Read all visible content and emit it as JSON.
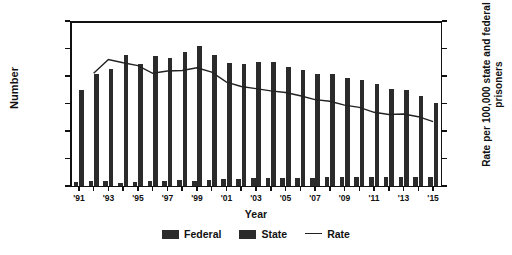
{
  "chart_data": {
    "type": "bar",
    "title": "",
    "xlabel": "Year",
    "ylabel": "Number",
    "ylabel_right": "Rate per 100,000 state and federal prisoners",
    "ylim": [
      0,
      30000
    ],
    "ylim_right": [
      0,
      3000
    ],
    "grid": false,
    "legend_position": "bottom-center",
    "x": [
      1991,
      1992,
      1993,
      1994,
      1995,
      1996,
      1997,
      1998,
      1999,
      2000,
      2001,
      2002,
      2003,
      2004,
      2005,
      2006,
      2007,
      2008,
      2009,
      2010,
      2011,
      2012,
      2013,
      2014,
      2015
    ],
    "categories": [
      "'91",
      "'92",
      "'93",
      "'94",
      "'95",
      "'96",
      "'97",
      "'98",
      "'99",
      "'00",
      "'01",
      "'02",
      "'03",
      "'04",
      "'05",
      "'06",
      "'07",
      "'08",
      "'09",
      "'10",
      "'11",
      "'12",
      "'13",
      "'14",
      "'15"
    ],
    "tick_labels_x": [
      "'91",
      "'93",
      "'95",
      "'97",
      "'99",
      "'01",
      "'03",
      "'05",
      "'07",
      "'09",
      "'11",
      "'13",
      "'15"
    ],
    "tick_labels_y_left": [
      "0",
      "5,000",
      "10,000",
      "15,000",
      "20,000",
      "25,000",
      "30,000"
    ],
    "tick_values_y_left": [
      0,
      5000,
      10000,
      15000,
      20000,
      25000,
      30000
    ],
    "tick_labels_y_right": [
      "0",
      "500",
      "1,000",
      "1,500",
      "2,000",
      "2,500",
      "3,000"
    ],
    "tick_values_y_right": [
      0,
      500,
      1000,
      1500,
      2000,
      2500,
      3000
    ],
    "series": [
      {
        "name": "Federal",
        "axis": "left",
        "color": "#2b2b2b",
        "values": [
          700,
          900,
          900,
          500,
          800,
          900,
          1000,
          1100,
          1000,
          1100,
          1200,
          1300,
          1400,
          1400,
          1500,
          1500,
          1500,
          1600,
          1600,
          1700,
          1700,
          1700,
          1700,
          1700,
          1600
        ]
      },
      {
        "name": "State",
        "axis": "left",
        "color": "#2b2b2b",
        "values": [
          17400,
          20400,
          21200,
          23900,
          22200,
          23700,
          23300,
          24300,
          25400,
          23900,
          22300,
          22100,
          22500,
          22500,
          21600,
          21100,
          20400,
          20400,
          19700,
          19300,
          18500,
          17700,
          17500,
          16300,
          15100
        ]
      },
      {
        "name": "Rate",
        "axis": "right",
        "type": "line",
        "color": "#222222",
        "values": [
          null,
          2050,
          2300,
          2240,
          2190,
          2050,
          2090,
          2100,
          2150,
          2070,
          1890,
          1810,
          1770,
          1730,
          1700,
          1640,
          1570,
          1540,
          1470,
          1430,
          1340,
          1300,
          1310,
          1260,
          1170
        ]
      }
    ],
    "legend": [
      {
        "label": "Federal",
        "marker": "swatch"
      },
      {
        "label": "State",
        "marker": "swatch"
      },
      {
        "label": "Rate",
        "marker": "line"
      }
    ]
  }
}
